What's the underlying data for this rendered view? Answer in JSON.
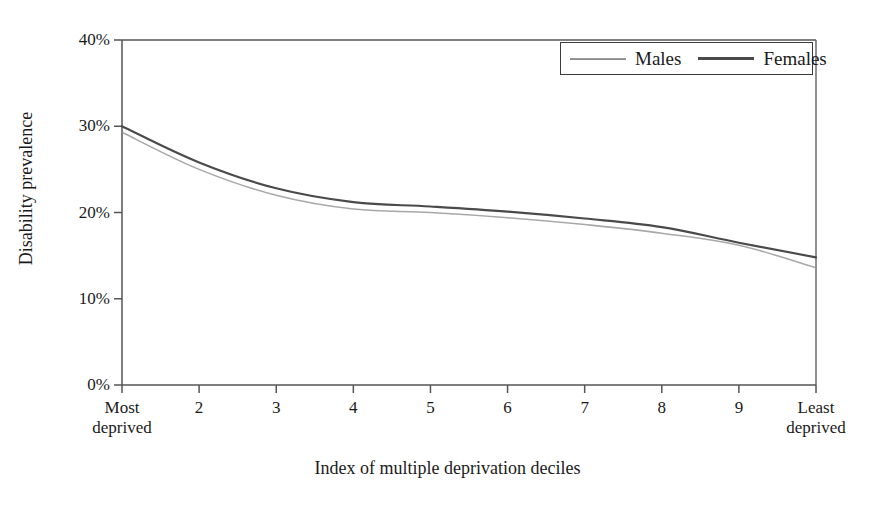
{
  "chart_data": {
    "type": "line",
    "title": "",
    "xlabel": "Index of multiple deprivation deciles",
    "ylabel": "Disability prevalence",
    "categories": [
      "Most deprived",
      "2",
      "3",
      "4",
      "5",
      "6",
      "7",
      "8",
      "9",
      "Least deprived"
    ],
    "x": [
      1,
      2,
      3,
      4,
      5,
      6,
      7,
      8,
      9,
      10
    ],
    "xtick_labels": [
      {
        "line1": "Most",
        "line2": "deprived"
      },
      {
        "line1": "2",
        "line2": ""
      },
      {
        "line1": "3",
        "line2": ""
      },
      {
        "line1": "4",
        "line2": ""
      },
      {
        "line1": "5",
        "line2": ""
      },
      {
        "line1": "6",
        "line2": ""
      },
      {
        "line1": "7",
        "line2": ""
      },
      {
        "line1": "8",
        "line2": ""
      },
      {
        "line1": "9",
        "line2": ""
      },
      {
        "line1": "Least",
        "line2": "deprived"
      }
    ],
    "ytick_labels": [
      "40%",
      "30%",
      "20%",
      "10%",
      "0%"
    ],
    "ytick_values": [
      40,
      30,
      20,
      10,
      0
    ],
    "ylim": [
      0,
      40
    ],
    "grid": false,
    "legend_position": "top-right",
    "series": [
      {
        "name": "Males",
        "color": "#8f8f8f",
        "style": "thin-light",
        "values": [
          29.3,
          25.0,
          22.0,
          20.4,
          20.0,
          19.4,
          18.6,
          17.6,
          16.2,
          13.6
        ]
      },
      {
        "name": "Females",
        "color": "#4a4a4a",
        "style": "solid-dark",
        "values": [
          30.0,
          25.8,
          22.8,
          21.2,
          20.7,
          20.1,
          19.3,
          18.3,
          16.5,
          14.8
        ]
      }
    ]
  },
  "legend": {
    "males_label": "Males",
    "females_label": "Females"
  },
  "axes": {
    "frame_color": "#555555",
    "text_color": "#1a1a1a"
  }
}
